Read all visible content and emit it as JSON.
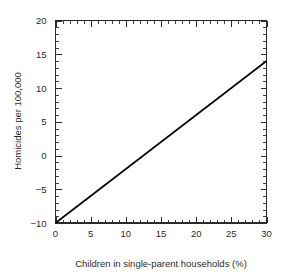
{
  "chart_data": {
    "type": "line",
    "title": "",
    "xlabel": "Children in single-parent households (%)",
    "ylabel": "Homicides per 100,000",
    "xlim": [
      0,
      30
    ],
    "ylim": [
      -10,
      20
    ],
    "xticks": [
      0,
      5,
      10,
      15,
      20,
      25,
      30
    ],
    "xtick_labels": [
      "0",
      "5",
      "10",
      "15",
      "20",
      "25",
      "30"
    ],
    "yticks": [
      -10,
      -5,
      0,
      5,
      10,
      15,
      20
    ],
    "ytick_labels": [
      "-10",
      "-5",
      "0",
      "5",
      "10",
      "15",
      "20"
    ],
    "x_minor_step": 1,
    "y_minor_step": 1,
    "grid": false,
    "legend": false,
    "legend_position": "none",
    "series": [
      {
        "name": "Regression line",
        "color": "#000000",
        "line_width": 1.6,
        "slope": 0.8,
        "intercept": -10,
        "x": [
          0,
          30
        ],
        "values": [
          -10,
          14
        ]
      }
    ]
  },
  "axes": {
    "x_title": "Children in single-parent households (%)",
    "y_title": "Homicides per 100,000"
  },
  "labels": {
    "x": [
      "0",
      "5",
      "10",
      "15",
      "20",
      "25",
      "30"
    ],
    "y": [
      "20",
      "15",
      "10",
      "5",
      "0",
      "-5",
      "-10"
    ]
  },
  "colors": {
    "background": "#ffffff",
    "axis": "#2b2b2b",
    "line": "#000000",
    "text": "#2b2b2b"
  }
}
